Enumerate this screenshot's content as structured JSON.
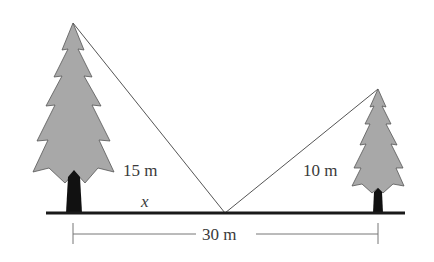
{
  "diagram": {
    "type": "two-trees-rope-problem",
    "labels": {
      "left_height": "15 m",
      "right_height": "10 m",
      "unknown": "x",
      "total_distance": "30 m"
    },
    "values": {
      "left_tree_height_m": 15,
      "right_tree_height_m": 10,
      "distance_between_trees_m": 30
    },
    "colors": {
      "foliage": "#a8a8a8",
      "trunk": "#111111",
      "ground": "#1a1a1a",
      "lines": "#555555",
      "text": "#3a3a3a"
    }
  }
}
